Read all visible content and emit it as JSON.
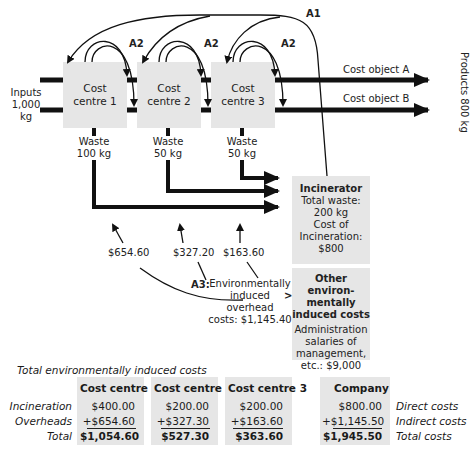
{
  "diagram": {
    "inputs": {
      "label": "Inputs",
      "value": "1,000 kg"
    },
    "cost_centres": [
      {
        "line1": "Cost",
        "line2": "centre 1",
        "waste_label": "Waste",
        "waste_value": "100 kg",
        "overhead": "$654.60"
      },
      {
        "line1": "Cost",
        "line2": "centre 2",
        "waste_label": "Waste",
        "waste_value": "50 kg",
        "overhead": "$327.20"
      },
      {
        "line1": "Cost",
        "line2": "centre 3",
        "waste_label": "Waste",
        "waste_value": "50 kg",
        "overhead": "$163.60"
      }
    ],
    "arrow_labels": {
      "a1": "A1",
      "a2": "A2",
      "a3": "A3:"
    },
    "cost_objects": [
      "Cost object A",
      "Cost object B"
    ],
    "products": "Products 800 kg",
    "incinerator": {
      "title": "Incinerator",
      "line1": "Total waste:",
      "line2": "200 kg",
      "line3": "Cost of",
      "line4": "Incineration:",
      "line5": "$800"
    },
    "overhead_note": {
      "line1": "Environmentally",
      "line2": "induced overhead",
      "line3": "costs: $1,145.40",
      "arrow": ">"
    },
    "other_costs": {
      "title1": "Other environ-",
      "title2": "mentally",
      "title3": "induced costs",
      "line1": "Administration",
      "line2": "salaries of",
      "line3": "management,",
      "line4": "etc.: $9,000"
    }
  },
  "summary": {
    "title": "Total environmentally induced costs",
    "row_labels": [
      "Incineration",
      "Overheads",
      "Total"
    ],
    "columns": [
      {
        "header": "Cost centre 1",
        "values": [
          "$400.00",
          "+$654.60",
          "$1,054.60"
        ]
      },
      {
        "header": "Cost centre 2",
        "values": [
          "$200.00",
          "+$327.30",
          "$527.30"
        ]
      },
      {
        "header": "Cost centre 3",
        "values": [
          "$200.00",
          "+$163.60",
          "$363.60"
        ]
      },
      {
        "header": "Company",
        "values": [
          "$800.00",
          "+$1,145.50",
          "$1,945.50"
        ]
      }
    ],
    "right_labels": [
      "Direct costs",
      "Indirect costs",
      "Total costs"
    ]
  }
}
